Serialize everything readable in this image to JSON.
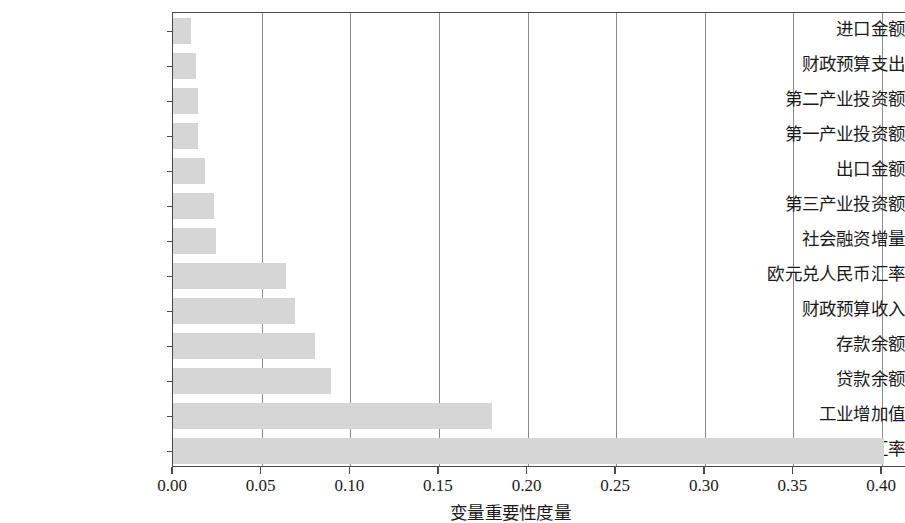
{
  "chart_data": {
    "type": "bar",
    "orientation": "horizontal",
    "title": "",
    "subtitle": "",
    "xlabel": "变量重要性度量",
    "ylabel": "",
    "xlim": [
      0.0,
      0.4135
    ],
    "xticks": [
      0.0,
      0.05,
      0.1,
      0.15,
      0.2,
      0.25,
      0.3,
      0.35,
      0.4
    ],
    "xtick_labels": [
      "0.00",
      "0.05",
      "0.10",
      "0.15",
      "0.20",
      "0.25",
      "0.30",
      "0.35",
      "0.40"
    ],
    "grid": "vertical-only",
    "legend": null,
    "bar_color": "#d6d6d6",
    "axis_color": "#4a4a4a",
    "gridline_color": "#8c8c8c",
    "categories": [
      "进口金额",
      "财政预算支出",
      "第二产业投资额",
      "第一产业投资额",
      "出口金额",
      "第三产业投资额",
      "社会融资增量",
      "欧元兑人民币汇率",
      "财政预算收入",
      "存款余额",
      "贷款余额",
      "工业增加值",
      "美元兑人民币汇率"
    ],
    "values": [
      0.01,
      0.013,
      0.014,
      0.014,
      0.018,
      0.023,
      0.024,
      0.064,
      0.069,
      0.08,
      0.089,
      0.18,
      0.401
    ]
  }
}
